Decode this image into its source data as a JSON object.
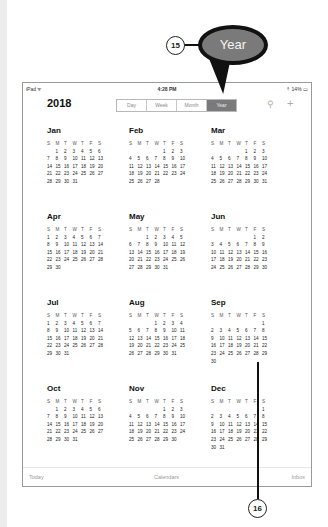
{
  "status_bar": {
    "carrier": "iPad ᯤ",
    "time": "4:28 PM",
    "battery": "⇡ 14% ▭"
  },
  "header": {
    "year": "2018",
    "segments": [
      {
        "label": "Day",
        "active": false
      },
      {
        "label": "Week",
        "active": false
      },
      {
        "label": "Month",
        "active": false
      },
      {
        "label": "Year",
        "active": true
      }
    ],
    "search_icon": "⚲",
    "add_icon": "+"
  },
  "weekday_headers": [
    "S",
    "M",
    "T",
    "W",
    "T",
    "F",
    "S"
  ],
  "months": [
    {
      "name": "Jan",
      "weeks": [
        [
          "",
          "1",
          "2",
          "3",
          "4",
          "5",
          "6"
        ],
        [
          "7",
          "8",
          "9",
          "10",
          "11",
          "12",
          "13"
        ],
        [
          "14",
          "15",
          "16",
          "17",
          "18",
          "19",
          "20"
        ],
        [
          "21",
          "22",
          "23",
          "24",
          "25",
          "26",
          "27"
        ],
        [
          "28",
          "29",
          "30",
          "31",
          "",
          "",
          ""
        ],
        [
          "",
          "",
          "",
          "",
          "",
          "",
          ""
        ]
      ]
    },
    {
      "name": "Feb",
      "weeks": [
        [
          "",
          "",
          "",
          "",
          "1",
          "2",
          "3"
        ],
        [
          "4",
          "5",
          "6",
          "7",
          "8",
          "9",
          "10"
        ],
        [
          "11",
          "12",
          "13",
          "14",
          "15",
          "16",
          "17"
        ],
        [
          "18",
          "19",
          "20",
          "21",
          "22",
          "23",
          "24"
        ],
        [
          "25",
          "26",
          "27",
          "28",
          "",
          "",
          ""
        ],
        [
          "",
          "",
          "",
          "",
          "",
          "",
          ""
        ]
      ]
    },
    {
      "name": "Mar",
      "weeks": [
        [
          "",
          "",
          "",
          "",
          "1",
          "2",
          "3"
        ],
        [
          "4",
          "5",
          "6",
          "7",
          "8",
          "9",
          "10"
        ],
        [
          "11",
          "12",
          "13",
          "14",
          "15",
          "16",
          "17"
        ],
        [
          "18",
          "19",
          "20",
          "21",
          "22",
          "23",
          "24"
        ],
        [
          "25",
          "26",
          "27",
          "28",
          "29",
          "30",
          "31"
        ],
        [
          "",
          "",
          "",
          "",
          "",
          "",
          ""
        ]
      ]
    },
    {
      "name": "Apr",
      "weeks": [
        [
          "1",
          "2",
          "3",
          "4",
          "5",
          "6",
          "7"
        ],
        [
          "8",
          "9",
          "10",
          "11",
          "12",
          "13",
          "14"
        ],
        [
          "15",
          "16",
          "17",
          "18",
          "19",
          "20",
          "21"
        ],
        [
          "22",
          "23",
          "24",
          "25",
          "26",
          "27",
          "28"
        ],
        [
          "29",
          "30",
          "",
          "",
          "",
          "",
          ""
        ],
        [
          "",
          "",
          "",
          "",
          "",
          "",
          ""
        ]
      ]
    },
    {
      "name": "May",
      "weeks": [
        [
          "",
          "",
          "1",
          "2",
          "3",
          "4",
          "5"
        ],
        [
          "6",
          "7",
          "8",
          "9",
          "10",
          "11",
          "12"
        ],
        [
          "13",
          "14",
          "15",
          "16",
          "17",
          "18",
          "19"
        ],
        [
          "20",
          "21",
          "22",
          "23",
          "24",
          "25",
          "26"
        ],
        [
          "27",
          "28",
          "29",
          "30",
          "31",
          "",
          ""
        ],
        [
          "",
          "",
          "",
          "",
          "",
          "",
          ""
        ]
      ]
    },
    {
      "name": "Jun",
      "weeks": [
        [
          "",
          "",
          "",
          "",
          "",
          "1",
          "2"
        ],
        [
          "3",
          "4",
          "5",
          "6",
          "7",
          "8",
          "9"
        ],
        [
          "10",
          "11",
          "12",
          "13",
          "14",
          "15",
          "16"
        ],
        [
          "17",
          "18",
          "19",
          "20",
          "21",
          "22",
          "23"
        ],
        [
          "24",
          "25",
          "26",
          "27",
          "28",
          "29",
          "30"
        ],
        [
          "",
          "",
          "",
          "",
          "",
          "",
          ""
        ]
      ]
    },
    {
      "name": "Jul",
      "weeks": [
        [
          "1",
          "2",
          "3",
          "4",
          "5",
          "6",
          "7"
        ],
        [
          "8",
          "9",
          "10",
          "11",
          "12",
          "13",
          "14"
        ],
        [
          "15",
          "16",
          "17",
          "18",
          "19",
          "20",
          "21"
        ],
        [
          "22",
          "23",
          "24",
          "25",
          "26",
          "27",
          "28"
        ],
        [
          "29",
          "30",
          "31",
          "",
          "",
          "",
          ""
        ],
        [
          "",
          "",
          "",
          "",
          "",
          "",
          ""
        ]
      ]
    },
    {
      "name": "Aug",
      "weeks": [
        [
          "",
          "",
          "",
          "1",
          "2",
          "3",
          "4"
        ],
        [
          "5",
          "6",
          "7",
          "8",
          "9",
          "10",
          "11"
        ],
        [
          "12",
          "13",
          "14",
          "15",
          "16",
          "17",
          "18"
        ],
        [
          "19",
          "20",
          "21",
          "22",
          "23",
          "24",
          "25"
        ],
        [
          "26",
          "27",
          "28",
          "29",
          "30",
          "31",
          ""
        ],
        [
          "",
          "",
          "",
          "",
          "",
          "",
          ""
        ]
      ]
    },
    {
      "name": "Sep",
      "weeks": [
        [
          "",
          "",
          "",
          "",
          "",
          "",
          "1"
        ],
        [
          "2",
          "3",
          "4",
          "5",
          "6",
          "7",
          "8"
        ],
        [
          "9",
          "10",
          "11",
          "12",
          "13",
          "14",
          "15"
        ],
        [
          "16",
          "17",
          "18",
          "19",
          "20",
          "21",
          "22"
        ],
        [
          "23",
          "24",
          "25",
          "26",
          "27",
          "28",
          "29"
        ],
        [
          "30",
          "",
          "",
          "",
          "",
          "",
          ""
        ]
      ]
    },
    {
      "name": "Oct",
      "weeks": [
        [
          "",
          "1",
          "2",
          "3",
          "4",
          "5",
          "6"
        ],
        [
          "7",
          "8",
          "9",
          "10",
          "11",
          "12",
          "13"
        ],
        [
          "14",
          "15",
          "16",
          "17",
          "18",
          "19",
          "20"
        ],
        [
          "21",
          "22",
          "23",
          "24",
          "25",
          "26",
          "27"
        ],
        [
          "28",
          "29",
          "30",
          "31",
          "",
          "",
          ""
        ],
        [
          "",
          "",
          "",
          "",
          "",
          "",
          ""
        ]
      ]
    },
    {
      "name": "Nov",
      "weeks": [
        [
          "",
          "",
          "",
          "",
          "1",
          "2",
          "3"
        ],
        [
          "4",
          "5",
          "6",
          "7",
          "8",
          "9",
          "10"
        ],
        [
          "11",
          "12",
          "13",
          "14",
          "15",
          "16",
          "17"
        ],
        [
          "18",
          "19",
          "20",
          "21",
          "22",
          "23",
          "24"
        ],
        [
          "25",
          "26",
          "27",
          "28",
          "29",
          "30",
          ""
        ],
        [
          "",
          "",
          "",
          "",
          "",
          "",
          ""
        ]
      ]
    },
    {
      "name": "Dec",
      "weeks": [
        [
          "",
          "",
          "",
          "",
          "",
          "",
          "1"
        ],
        [
          "2",
          "3",
          "4",
          "5",
          "6",
          "7",
          "8"
        ],
        [
          "9",
          "10",
          "11",
          "12",
          "13",
          "14",
          "15"
        ],
        [
          "16",
          "17",
          "18",
          "19",
          "20",
          "21",
          "22"
        ],
        [
          "23",
          "24",
          "25",
          "26",
          "27",
          "28",
          "29"
        ],
        [
          "30",
          "31",
          "",
          "",
          "",
          "",
          ""
        ]
      ]
    }
  ],
  "tab_bar": {
    "today": "Today",
    "calendars": "Calendars",
    "inbox": "Inbox"
  },
  "callouts": {
    "bubble_label": "Year",
    "step_15": "15",
    "step_16": "16"
  }
}
